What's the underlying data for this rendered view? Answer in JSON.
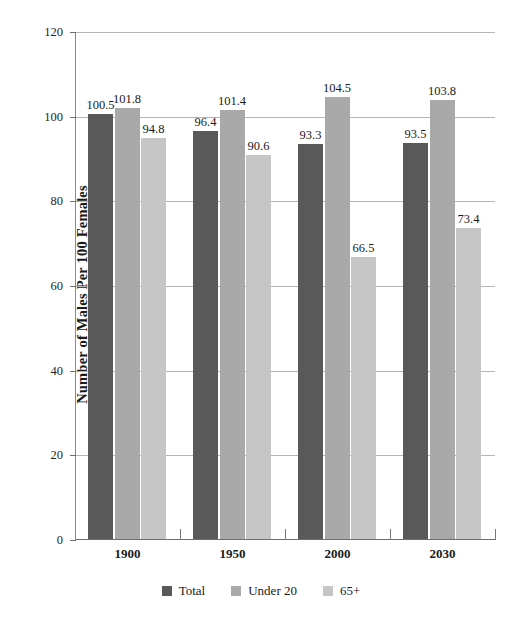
{
  "chart_data": {
    "type": "bar",
    "title": "",
    "subtitle": "",
    "xlabel": "",
    "ylabel": "Number of Males Per 100 Females",
    "categories": [
      "1900",
      "1950",
      "2000",
      "2030"
    ],
    "series": [
      {
        "name": "Total",
        "color": "#595959",
        "values": [
          100.5,
          96.4,
          93.3,
          93.5
        ]
      },
      {
        "name": "Under 20",
        "color": "#a9a9a9",
        "values": [
          101.8,
          101.4,
          104.5,
          103.8
        ]
      },
      {
        "name": "65+",
        "color": "#c6c6c6",
        "values": [
          94.8,
          90.6,
          66.5,
          73.4
        ]
      }
    ],
    "ylim": [
      0,
      120
    ],
    "yticks": [
      0,
      20,
      40,
      60,
      80,
      100,
      120
    ],
    "ytick_labels": [
      "0",
      "20",
      "40",
      "60",
      "80",
      "100",
      "120"
    ],
    "grid": true,
    "grid_axis": "y",
    "legend_position": "bottom",
    "value_labels": true,
    "background_color": "#ffffff",
    "gridline_color": "#b4b4b4",
    "axis_color": "#6e6e6e"
  }
}
